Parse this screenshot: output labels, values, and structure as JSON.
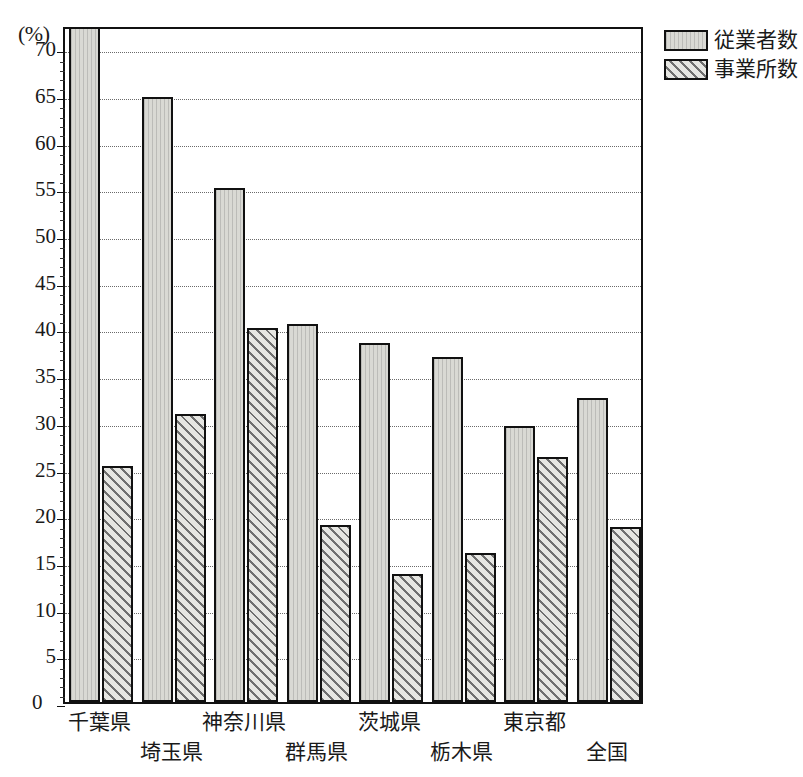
{
  "chart_data": {
    "type": "bar",
    "title": "",
    "xlabel": "",
    "ylabel": "",
    "unit_label": "(%)",
    "ylim": [
      0,
      72.5
    ],
    "ytick_step": 5,
    "yticks": [
      0,
      5,
      10,
      15,
      20,
      25,
      30,
      35,
      40,
      45,
      50,
      55,
      60,
      65,
      70
    ],
    "ytick_labels": [
      "0",
      "5",
      "10",
      "15",
      "20",
      "25",
      "30",
      "35",
      "40",
      "45",
      "50",
      "55",
      "60",
      "65",
      "70"
    ],
    "grid": true,
    "grid_style": "dotted-horizontal",
    "legend_position": "top-right-outside",
    "categories": [
      "千葉県",
      "埼玉県",
      "神奈川県",
      "群馬県",
      "茨城県",
      "栃木県",
      "東京都",
      "全国"
    ],
    "series": [
      {
        "name": "従業者数",
        "values": [
          72.3,
          64.8,
          55.0,
          40.5,
          38.5,
          37.0,
          29.6,
          32.6
        ],
        "fill": "#d9d9d4",
        "pattern": "solid-light-gray"
      },
      {
        "name": "事業所数",
        "values": [
          25.3,
          30.8,
          40.0,
          19.0,
          13.7,
          16.0,
          26.2,
          18.7
        ],
        "fill": "#e6e6e2",
        "pattern": "diagonal-hatch"
      }
    ]
  },
  "legend": {
    "items": [
      {
        "label": "従業者数",
        "swatch": "solid-light-gray"
      },
      {
        "label": "事業所数",
        "swatch": "diagonal-hatch"
      }
    ]
  },
  "axis": {
    "unit": "(%)",
    "zero": "0"
  },
  "colors": {
    "axis": "#111111",
    "grid": "#6a6a6a",
    "series_employees": "#d9d9d4",
    "series_establishments": "#e6e6e2",
    "background": "#ffffff"
  }
}
